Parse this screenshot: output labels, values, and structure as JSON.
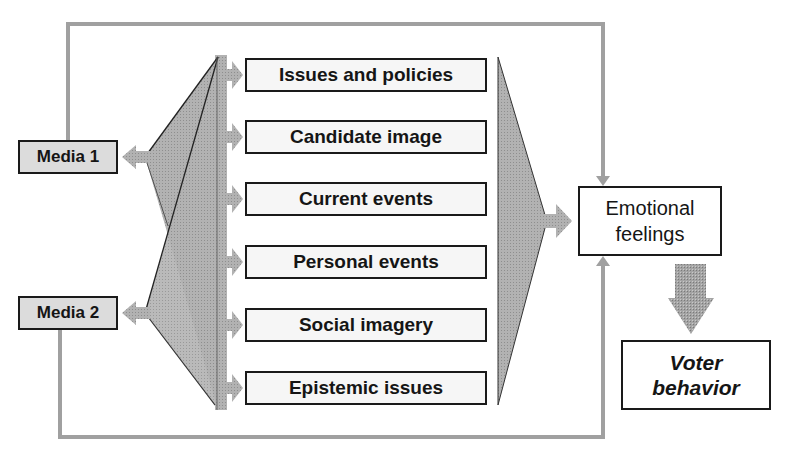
{
  "diagram": {
    "caption_fragment": "",
    "media": [
      {
        "label": "Media 1"
      },
      {
        "label": "Media 2"
      }
    ],
    "factors": [
      {
        "label": "Issues and policies"
      },
      {
        "label": "Candidate image"
      },
      {
        "label": "Current events"
      },
      {
        "label": "Personal events"
      },
      {
        "label": "Social imagery"
      },
      {
        "label": "Epistemic issues"
      }
    ],
    "emotional": {
      "line1": "Emotional",
      "line2": "feelings"
    },
    "voter": {
      "line1": "Voter",
      "line2": "behavior"
    },
    "colors": {
      "arrow_gray": "#a8a8a8",
      "funnel_gray": "#b4b4b4",
      "feedback_gray": "#a0a0a0",
      "box_border": "#1a1a1a",
      "media_fill": "#dcdcdc",
      "factor_fill": "#f6f6f6"
    }
  }
}
